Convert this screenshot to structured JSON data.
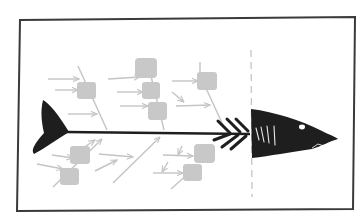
{
  "diagram": {
    "type": "fishbone",
    "colors": {
      "background": "#ffffff",
      "frame": "#3a3a3a",
      "shark": "#1e1e1e",
      "cause": "#c8c8c8",
      "cause_arrow": "#c4c4c4",
      "divider": "#c0c0c0",
      "gill": "#e8e8e8"
    },
    "frame": {
      "x": 18,
      "y": 19,
      "w": 336,
      "h": 190
    },
    "divider_x": 251,
    "spine": {
      "x1": 68,
      "y1": 132,
      "x2": 250,
      "y2": 134
    },
    "labels": []
  }
}
